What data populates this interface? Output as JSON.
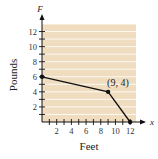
{
  "chart_data": {
    "type": "line",
    "title": "",
    "xlabel": "Feet",
    "ylabel": "Pounds",
    "x_axis_variable": "x",
    "y_axis_variable": "F",
    "x": [
      0,
      9,
      12
    ],
    "series": [
      {
        "name": "F",
        "values": [
          6,
          4,
          0
        ]
      }
    ],
    "points": [
      [
        0,
        6
      ],
      [
        9,
        4
      ],
      [
        12,
        0
      ]
    ],
    "annotations": [
      {
        "text": "(9, 4)",
        "x": 9,
        "y": 4
      }
    ],
    "xticks": [
      2,
      4,
      6,
      8,
      10,
      12
    ],
    "yticks": [
      2,
      4,
      6,
      8,
      10,
      12
    ],
    "xlim": [
      0,
      12.8
    ],
    "ylim": [
      0,
      13
    ],
    "grid": true,
    "grid_style": "horizontal lines",
    "legend": null,
    "colors": {
      "plot_background": "#f0ddc0",
      "grid": "#ffffff",
      "line": "#111111",
      "axis": "#111111"
    }
  }
}
